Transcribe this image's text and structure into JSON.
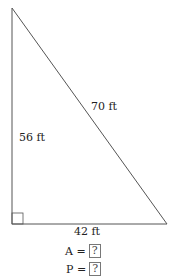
{
  "figure": {
    "shape": "right-triangle",
    "colors": {
      "stroke": "#555555",
      "text": "#222222",
      "background": "#ffffff"
    },
    "sides": {
      "hypotenuse": "70 ft",
      "vertical_leg": "56 ft",
      "horizontal_leg": "42 ft"
    },
    "right_angle_marker": true
  },
  "questions": [
    {
      "label": "A =",
      "answer": "?"
    },
    {
      "label": "P =",
      "answer": "?"
    }
  ]
}
